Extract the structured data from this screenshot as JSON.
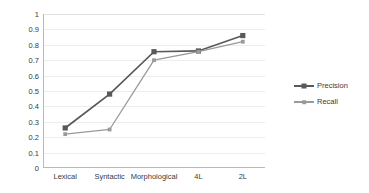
{
  "chart_data": {
    "type": "line",
    "title": "",
    "xlabel": "",
    "ylabel": "",
    "categories": [
      "Lexical",
      "Syntactic",
      "Morphological",
      "4L",
      "2L"
    ],
    "series": [
      {
        "name": "Precision",
        "color": "#595959",
        "marker": "square",
        "values": [
          0.26,
          0.48,
          0.755,
          0.76,
          0.86
        ]
      },
      {
        "name": "Recall",
        "color": "#9a9a9a",
        "marker": "square-small",
        "values": [
          0.22,
          0.25,
          0.7,
          0.755,
          0.82
        ]
      }
    ],
    "ylim": [
      0,
      1
    ],
    "ytick_step": 0.1,
    "yticks": [
      "1",
      "0.9",
      "0.8",
      "0.7",
      "0.6",
      "0.5",
      "0.4",
      "0.3",
      "0.2",
      "0.1",
      "0"
    ],
    "ytick_values": [
      1,
      0.9,
      0.8,
      0.7,
      0.6,
      0.5,
      0.4,
      0.3,
      0.2,
      0.1,
      0
    ],
    "grid": true,
    "grid_color": "#ededed",
    "legend_position": "right",
    "legend": [
      "Precision",
      "Recall"
    ],
    "background": "#ffffff",
    "axis_color": "#b9b9b9"
  },
  "legend": {
    "items": [
      {
        "label": "Precision"
      },
      {
        "label": "Recall"
      }
    ]
  }
}
